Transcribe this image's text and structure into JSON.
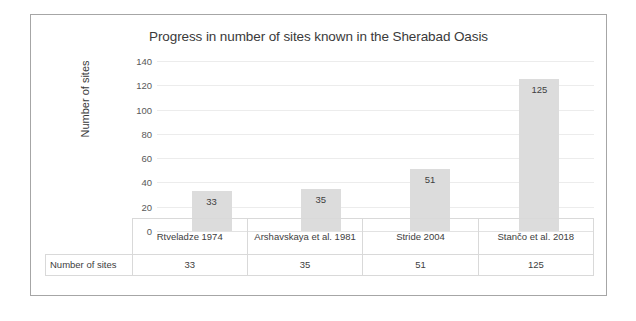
{
  "chart_data": {
    "type": "bar",
    "title": "Progress in number of sites known in the Sherabad Oasis",
    "xlabel": "",
    "ylabel": "Number of sites",
    "categories": [
      "Rtveladze 1974",
      "Arshavskaya et al. 1981",
      "Stride 2004",
      "Stančo et al. 2018"
    ],
    "values": [
      33,
      35,
      51,
      125
    ],
    "value_labels": [
      "33",
      "35",
      "51",
      "125"
    ],
    "ylim": [
      0,
      140
    ],
    "ytick_step": 20,
    "yticks": [
      140,
      120,
      100,
      80,
      60,
      40,
      20,
      0
    ],
    "ytick_labels": [
      "140",
      "120",
      "100",
      "80",
      "60",
      "40",
      "20",
      "0"
    ],
    "grid": true,
    "legend": false,
    "series": [
      {
        "name": "Number of sites",
        "values": [
          33,
          35,
          51,
          125
        ]
      }
    ],
    "bar_color": "#dcdcdc",
    "gridline_color": "#ececec",
    "text_color": "#3a3a3a",
    "data_table": {
      "row_header": "Number of sites",
      "columns": [
        "Rtveladze 1974",
        "Arshavskaya et al. 1981",
        "Stride 2004",
        "Stančo et al. 2018"
      ],
      "cells": [
        "33",
        "35",
        "51",
        "125"
      ]
    }
  }
}
